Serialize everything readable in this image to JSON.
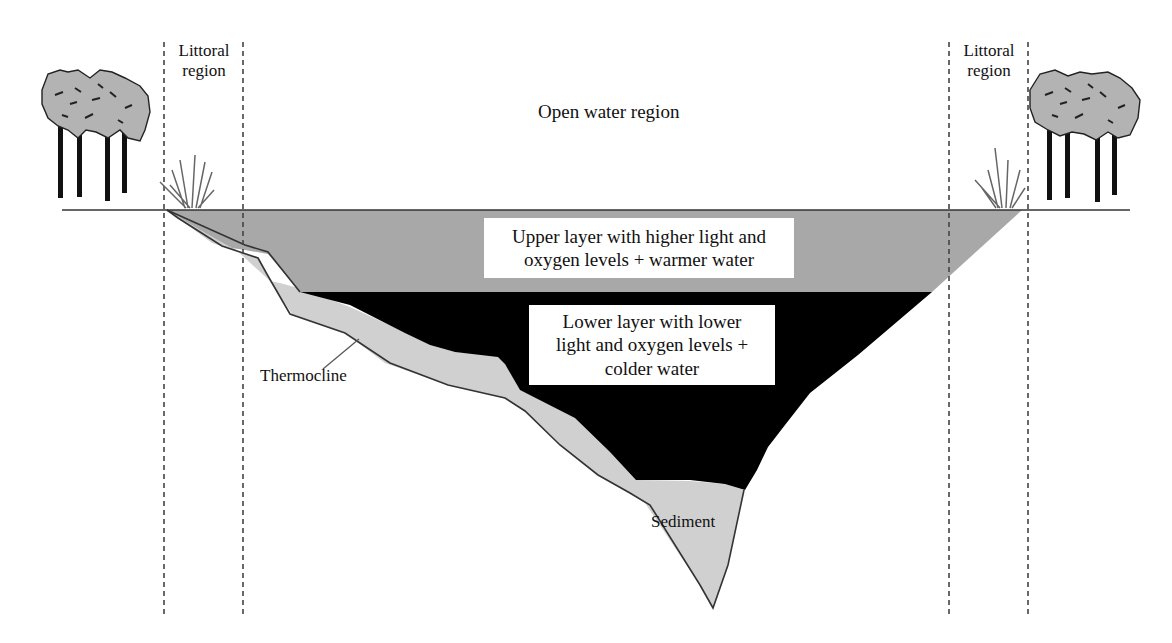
{
  "diagram": {
    "regions": {
      "littoral_left": {
        "line1": "Littoral",
        "line2": "region"
      },
      "littoral_right": {
        "line1": "Littoral",
        "line2": "region"
      },
      "open_water": "Open water region"
    },
    "layers": {
      "upper": {
        "line1": "Upper layer with higher light and",
        "line2": "oxygen levels + warmer water",
        "color": "#a9a9a9"
      },
      "lower": {
        "line1": "Lower layer with lower",
        "line2": "light and oxygen levels +",
        "line3": "colder water",
        "color": "#000000"
      },
      "sediment": {
        "label": "Sediment",
        "color": "#d3d3d3"
      }
    },
    "annotations": {
      "thermocline": "Thermocline"
    },
    "icons": {
      "trees_left": "tree-cluster-icon",
      "trees_right": "tree-cluster-icon",
      "grass_left": "reed-grass-icon",
      "grass_right": "reed-grass-icon"
    },
    "colors": {
      "background": "#ffffff",
      "outline": "#333333",
      "dashed_line": "#444444",
      "tree_foliage": "#b0b0b0",
      "tree_trunk": "#111111"
    }
  }
}
